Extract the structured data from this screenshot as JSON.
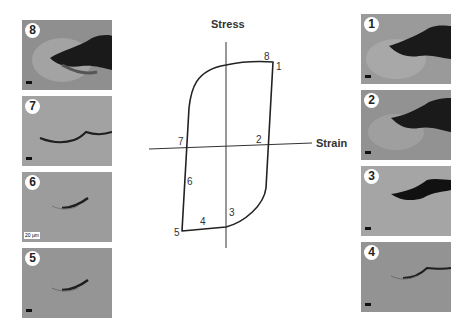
{
  "diagram": {
    "y_axis_label": "Stress",
    "x_axis_label": "Strain",
    "points": [
      {
        "id": "1",
        "label": "1"
      },
      {
        "id": "2",
        "label": "2"
      },
      {
        "id": "3",
        "label": "3"
      },
      {
        "id": "4",
        "label": "4"
      },
      {
        "id": "5",
        "label": "5"
      },
      {
        "id": "6",
        "label": "6"
      },
      {
        "id": "7",
        "label": "7"
      },
      {
        "id": "8",
        "label": "8"
      }
    ]
  },
  "left_panels": [
    {
      "label": "8"
    },
    {
      "label": "7"
    },
    {
      "label": "6",
      "scale": "20 µm"
    },
    {
      "label": "5"
    }
  ],
  "right_panels": [
    {
      "label": "1"
    },
    {
      "label": "2"
    },
    {
      "label": "3"
    },
    {
      "label": "4"
    }
  ]
}
